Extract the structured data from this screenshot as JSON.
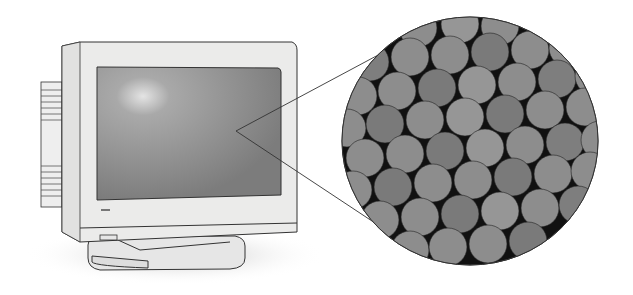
{
  "illustration": {
    "subject": "CRT monitor with magnified view of phosphor dots",
    "monitor": {
      "logo_label": "▭"
    },
    "magnifier": {
      "dot_colors": [
        "#8a8a8a",
        "#7a7a7a",
        "#959595"
      ],
      "background": "#111111"
    },
    "colors": {
      "bezel": "#ebebea",
      "screen": "#8e8e8e",
      "outline": "#333333"
    }
  }
}
